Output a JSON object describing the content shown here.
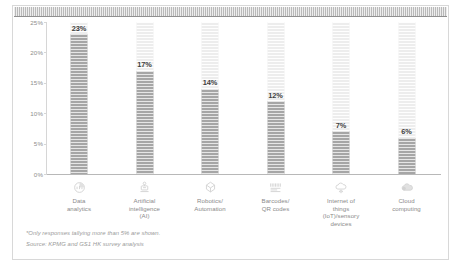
{
  "chart_data": {
    "type": "bar",
    "title": "",
    "xlabel": "",
    "ylabel": "",
    "ylim": [
      0,
      25
    ],
    "grid": false,
    "legend": "none",
    "categories": [
      "Data analytics",
      "Artificial intelligence (AI)",
      "Robotics/Automation",
      "Barcodes/QR codes",
      "Internet of things (IoT)/sensory devices",
      "Cloud computing"
    ],
    "values": [
      23,
      17,
      14,
      12,
      7,
      6
    ],
    "value_labels": [
      "23%",
      "17%",
      "14%",
      "12%",
      "7%",
      "6%"
    ],
    "ytick_labels": [
      "25%",
      "20%",
      "15%",
      "10%",
      "5%",
      "0%"
    ],
    "ytick_values": [
      25,
      20,
      15,
      10,
      5,
      0
    ],
    "bars": [
      {
        "label_lines": [
          "Data",
          "analytics"
        ],
        "value": 23,
        "value_label": "23%",
        "icon": "data-analytics-icon"
      },
      {
        "label_lines": [
          "Artificial",
          "intelligence",
          "(AI)"
        ],
        "value": 17,
        "value_label": "17%",
        "icon": "artificial-intelligence-icon"
      },
      {
        "label_lines": [
          "Robotics/",
          "Automation"
        ],
        "value": 14,
        "value_label": "14%",
        "icon": "robotics-automation-icon"
      },
      {
        "label_lines": [
          "Barcodes/",
          "QR codes"
        ],
        "value": 12,
        "value_label": "12%",
        "icon": "barcode-qr-icon"
      },
      {
        "label_lines": [
          "Internet of",
          "things",
          "(IoT)/sensory",
          "devices"
        ],
        "value": 7,
        "value_label": "7%",
        "icon": "internet-of-things-cloud-icon"
      },
      {
        "label_lines": [
          "Cloud",
          "computing"
        ],
        "value": 6,
        "value_label": "6%",
        "icon": "cloud-computing-icon"
      }
    ]
  },
  "footnotes": {
    "line1": "*Only responses tallying more than 5% are shown.",
    "line2": "Source: KPMG and GS1 HK survey analysis"
  },
  "colors": {
    "bar_fill": "#a6a6a6",
    "ghost_fill": "#ededed",
    "axis": "#d6d6d6",
    "baseline": "#b8b8b8",
    "tick_text": "#8d8d8d",
    "category_text": "#8a8a8a",
    "value_text": "#3f3f3f",
    "footnote_text": "#9a9a9a",
    "top_band": "#b9b9b9",
    "card_border": "#d8d8d8"
  }
}
